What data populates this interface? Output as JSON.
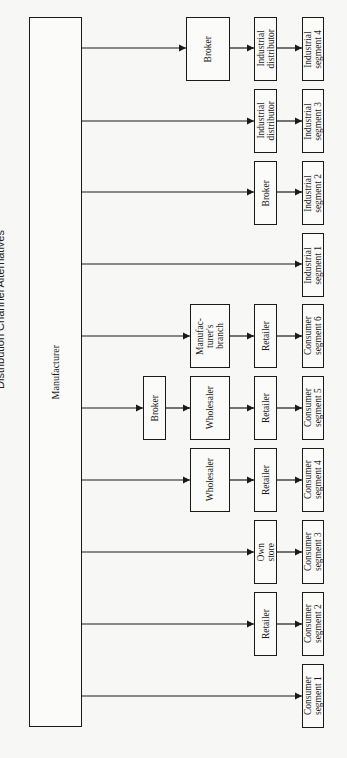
{
  "title": "Distribution Channel Alternatives",
  "root": "Manufacturer",
  "channels": [
    {
      "y": 48,
      "path": [
        "Broker",
        "Industrial\ndistributor"
      ],
      "segment": "Industrial\nsegment 4"
    },
    {
      "y": 121,
      "path": [
        "Industrial\ndistributor"
      ],
      "segment": "Industrial\nsegment 3"
    },
    {
      "y": 192,
      "path": [
        "Broker"
      ],
      "segment": "Industrial\nsegment 2"
    },
    {
      "y": 264,
      "path": [],
      "segment": "Industrial\nsegment 1"
    },
    {
      "y": 336,
      "path": [
        "Manufac-\nturer's\nbranch",
        "Retailer"
      ],
      "segment": "Consumer\nsegment 6"
    },
    {
      "y": 408,
      "path": [
        "Broker",
        "Wholesaler",
        "Retailer"
      ],
      "segment": "Consumer\nsegment 5"
    },
    {
      "y": 480,
      "path": [
        "Wholesaler",
        "Retailer"
      ],
      "segment": "Consumer\nsegment 4"
    },
    {
      "y": 552,
      "path": [
        "Own\nstore"
      ],
      "segment": "Consumer\nsegment 3"
    },
    {
      "y": 624,
      "path": [
        "Retailer"
      ],
      "segment": "Consumer\nsegment 2"
    },
    {
      "y": 696,
      "path": [],
      "segment": "Consumer\nsegment 1"
    }
  ],
  "labels": {
    "manufacturer": "Manufacturer",
    "ind4_broker": "Broker",
    "ind4_dist": "Industrial\ndistributor",
    "ind4_seg": "Industrial\nsegment 4",
    "ind3_dist": "Industrial\ndistributor",
    "ind3_seg": "Industrial\nsegment 3",
    "ind2_broker": "Broker",
    "ind2_seg": "Industrial\nsegment 2",
    "ind1_seg": "Industrial\nsegment 1",
    "c6_branch": "Manufac-\nturer's\nbranch",
    "c6_retailer": "Retailer",
    "c6_seg": "Consumer\nsegment 6",
    "c5_broker": "Broker",
    "c5_wholesaler": "Wholesaler",
    "c5_retailer": "Retailer",
    "c5_seg": "Consumer\nsegment 5",
    "c4_wholesaler": "Wholesaler",
    "c4_retailer": "Retailer",
    "c4_seg": "Consumer\nsegment 4",
    "c3_store": "Own\nstore",
    "c3_seg": "Consumer\nsegment 3",
    "c2_retailer": "Retailer",
    "c2_seg": "Consumer\nsegment 2",
    "c1_seg": "Consumer\nsegment 1"
  }
}
